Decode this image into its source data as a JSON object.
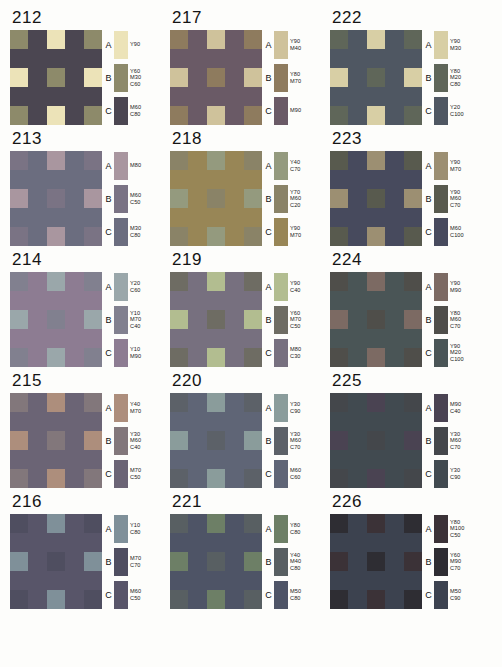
{
  "page": {
    "row_letters": [
      "A",
      "B",
      "C"
    ],
    "background": "#fdfdfb"
  },
  "charts": [
    {
      "number": "212",
      "swatches": [
        {
          "letter": "A",
          "color": "#ece3b8",
          "inks": [
            "Y90"
          ]
        },
        {
          "letter": "B",
          "color": "#8d8a6a",
          "inks": [
            "Y60",
            "M30",
            "C60"
          ]
        },
        {
          "letter": "C",
          "color": "#4b4651",
          "inks": [
            "M60",
            "C80"
          ]
        }
      ]
    },
    {
      "number": "217",
      "swatches": [
        {
          "letter": "A",
          "color": "#cfc29b",
          "inks": [
            "Y90",
            "M40"
          ]
        },
        {
          "letter": "B",
          "color": "#8e7b5e",
          "inks": [
            "Y80",
            "M70"
          ]
        },
        {
          "letter": "C",
          "color": "#6a5a66",
          "inks": [
            "M90"
          ]
        }
      ]
    },
    {
      "number": "222",
      "swatches": [
        {
          "letter": "A",
          "color": "#d8cfa5",
          "inks": [
            "Y90",
            "M30"
          ]
        },
        {
          "letter": "B",
          "color": "#5f6659",
          "inks": [
            "Y80",
            "M20",
            "C80"
          ]
        },
        {
          "letter": "C",
          "color": "#4f5762",
          "inks": [
            "Y20",
            "C100"
          ]
        }
      ]
    },
    {
      "number": "213",
      "swatches": [
        {
          "letter": "A",
          "color": "#a9969f",
          "inks": [
            "M80"
          ]
        },
        {
          "letter": "B",
          "color": "#7a7384",
          "inks": [
            "M60",
            "C50"
          ]
        },
        {
          "letter": "C",
          "color": "#6b6d7f",
          "inks": [
            "M30",
            "C80"
          ]
        }
      ]
    },
    {
      "number": "218",
      "swatches": [
        {
          "letter": "A",
          "color": "#949a7e",
          "inks": [
            "Y40",
            "C70"
          ]
        },
        {
          "letter": "B",
          "color": "#8a8367",
          "inks": [
            "Y70",
            "M60",
            "C20"
          ]
        },
        {
          "letter": "C",
          "color": "#988656",
          "inks": [
            "Y90",
            "M70"
          ]
        }
      ]
    },
    {
      "number": "223",
      "swatches": [
        {
          "letter": "A",
          "color": "#9c8f72",
          "inks": [
            "Y90",
            "M70"
          ]
        },
        {
          "letter": "B",
          "color": "#585a4e",
          "inks": [
            "Y90",
            "M60",
            "C70"
          ]
        },
        {
          "letter": "C",
          "color": "#474a5d",
          "inks": [
            "M60",
            "C100"
          ]
        }
      ]
    },
    {
      "number": "214",
      "swatches": [
        {
          "letter": "A",
          "color": "#9aa7aa",
          "inks": [
            "Y20",
            "C60"
          ]
        },
        {
          "letter": "B",
          "color": "#81808f",
          "inks": [
            "Y10",
            "M70",
            "C40"
          ]
        },
        {
          "letter": "C",
          "color": "#8d7c92",
          "inks": [
            "Y10",
            "M90"
          ]
        }
      ]
    },
    {
      "number": "219",
      "swatches": [
        {
          "letter": "A",
          "color": "#b2bd90",
          "inks": [
            "Y90",
            "C40"
          ]
        },
        {
          "letter": "B",
          "color": "#6e6c63",
          "inks": [
            "Y60",
            "M70",
            "C50"
          ]
        },
        {
          "letter": "C",
          "color": "#77707f",
          "inks": [
            "M80",
            "C30"
          ]
        }
      ]
    },
    {
      "number": "224",
      "swatches": [
        {
          "letter": "A",
          "color": "#7c6a63",
          "inks": [
            "Y90",
            "M90"
          ]
        },
        {
          "letter": "B",
          "color": "#4f4e4a",
          "inks": [
            "Y80",
            "M60",
            "C70"
          ]
        },
        {
          "letter": "C",
          "color": "#4a5556",
          "inks": [
            "Y90",
            "M20",
            "C100"
          ]
        }
      ]
    },
    {
      "number": "215",
      "swatches": [
        {
          "letter": "A",
          "color": "#ad8e7c",
          "inks": [
            "Y40",
            "M70"
          ]
        },
        {
          "letter": "B",
          "color": "#82777b",
          "inks": [
            "Y30",
            "M60",
            "C40"
          ]
        },
        {
          "letter": "C",
          "color": "#6b6475",
          "inks": [
            "M70",
            "C50"
          ]
        }
      ]
    },
    {
      "number": "220",
      "swatches": [
        {
          "letter": "A",
          "color": "#8a9c9b",
          "inks": [
            "Y30",
            "C90"
          ]
        },
        {
          "letter": "B",
          "color": "#5c6168",
          "inks": [
            "Y30",
            "M60",
            "C70"
          ]
        },
        {
          "letter": "C",
          "color": "#5f6576",
          "inks": [
            "M60",
            "C60"
          ]
        }
      ]
    },
    {
      "number": "225",
      "swatches": [
        {
          "letter": "A",
          "color": "#4a4352",
          "inks": [
            "M90",
            "C40"
          ]
        },
        {
          "letter": "B",
          "color": "#44474b",
          "inks": [
            "Y30",
            "M60",
            "C70"
          ]
        },
        {
          "letter": "C",
          "color": "#414a50",
          "inks": [
            "Y30",
            "C90"
          ]
        }
      ]
    },
    {
      "number": "216",
      "swatches": [
        {
          "letter": "A",
          "color": "#7f9099",
          "inks": [
            "Y10",
            "C80"
          ]
        },
        {
          "letter": "B",
          "color": "#4f4e60",
          "inks": [
            "M70",
            "C70"
          ]
        },
        {
          "letter": "C",
          "color": "#585569",
          "inks": [
            "M60",
            "C50"
          ]
        }
      ]
    },
    {
      "number": "221",
      "swatches": [
        {
          "letter": "A",
          "color": "#6d7f66",
          "inks": [
            "Y80",
            "C80"
          ]
        },
        {
          "letter": "B",
          "color": "#585f62",
          "inks": [
            "Y40",
            "M40",
            "C80"
          ]
        },
        {
          "letter": "C",
          "color": "#4e5466",
          "inks": [
            "M50",
            "C80"
          ]
        }
      ]
    },
    {
      "number": "226",
      "swatches": [
        {
          "letter": "A",
          "color": "#3b3237",
          "inks": [
            "Y80",
            "M100",
            "C50"
          ]
        },
        {
          "letter": "B",
          "color": "#2e2d33",
          "inks": [
            "Y60",
            "M90",
            "C70"
          ]
        },
        {
          "letter": "C",
          "color": "#3c424f",
          "inks": [
            "M50",
            "C90"
          ]
        }
      ]
    }
  ]
}
